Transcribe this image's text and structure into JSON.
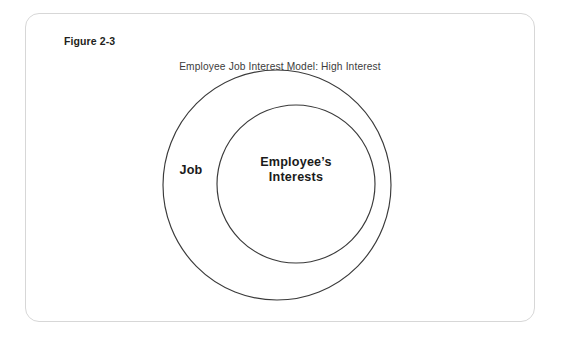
{
  "figure": {
    "number_label": "Figure 2-3",
    "title": "Employee Job Interest Model: High Interest"
  },
  "diagram": {
    "type": "concentric-circles",
    "outer_circle": {
      "label": "Job",
      "center_x": 277,
      "center_y": 185,
      "radius": 115,
      "stroke_color": "#3a3a3a",
      "fill_color": "#ffffff"
    },
    "inner_circle": {
      "label_line1": "Employee’s",
      "label_line2": "Interests",
      "center_x": 296,
      "center_y": 184,
      "radius": 79,
      "stroke_color": "#3a3a3a",
      "fill_color": "#ffffff"
    }
  },
  "colors": {
    "frame_border": "#d7d7d7",
    "page_background": "#ffffff",
    "circle_stroke": "#3a3a3a",
    "label_text": "#1a1a1a",
    "title_text": "#3c3c3c"
  }
}
